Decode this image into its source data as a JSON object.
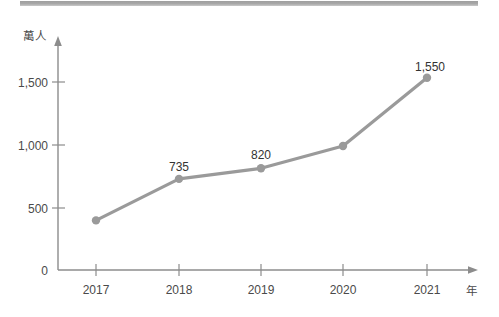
{
  "chart_data": {
    "type": "line",
    "title": "",
    "subtitle": "",
    "xlabel": "年",
    "ylabel": "萬人",
    "categories": [
      "2017",
      "2018",
      "2019",
      "2020",
      "2021"
    ],
    "x": [
      2017,
      2018,
      2019,
      2020,
      2021
    ],
    "values": [
      400,
      735,
      820,
      1000,
      1550
    ],
    "point_labels": [
      "",
      "735",
      "820",
      "",
      "1,550"
    ],
    "y_ticks": [
      0,
      500,
      1000,
      1500
    ],
    "y_tick_labels": [
      "0",
      "500",
      "1,000",
      "1,500"
    ],
    "x_tick_labels": [
      "2017",
      "2018",
      "2019",
      "2020",
      "2021"
    ],
    "ylim": [
      0,
      1700
    ],
    "xlim": [
      2016.5,
      2021.6
    ],
    "grid": false,
    "legend": false,
    "legend_position": "none",
    "series": [
      {
        "name": "",
        "values": [
          400,
          735,
          820,
          1000,
          1550
        ]
      }
    ],
    "annotations": [
      {
        "x": "2018",
        "y": 735,
        "text": "735"
      },
      {
        "x": "2019",
        "y": 820,
        "text": "820"
      },
      {
        "x": "2021",
        "y": 1550,
        "text": "1,550"
      }
    ]
  },
  "colors": {
    "line": "#9a9a9a",
    "marker": "#9a9a9a",
    "axis": "#8c8c8c",
    "text": "#4a4a4a",
    "label_text": "#333333",
    "top_bar": "#a5a5a5",
    "background": "#ffffff"
  },
  "axes": {
    "y_unit": "萬人",
    "x_unit": "年",
    "y_tick_0": "0",
    "y_tick_500": "500",
    "y_tick_1000": "1,000",
    "y_tick_1500": "1,500",
    "x_tick_2017": "2017",
    "x_tick_2018": "2018",
    "x_tick_2019": "2019",
    "x_tick_2020": "2020",
    "x_tick_2021": "2021"
  },
  "data_labels": {
    "p2018": "735",
    "p2019": "820",
    "p2021": "1,550"
  }
}
